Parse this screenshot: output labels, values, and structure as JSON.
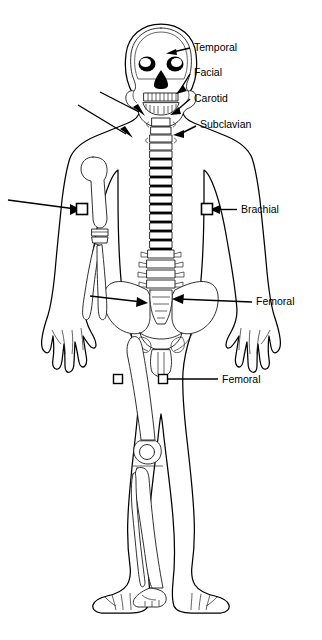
{
  "figure": {
    "view": "anterior full-body outline with partial skeleton",
    "background_color": "#ffffff",
    "line_color": "#000000",
    "text_color": "#000000",
    "width": 322,
    "height": 640
  },
  "labels": [
    {
      "id": "temporal",
      "text": "Temporal",
      "x": 194,
      "y": 48
    },
    {
      "id": "facial",
      "text": "Facial",
      "x": 194,
      "y": 73
    },
    {
      "id": "carotid",
      "text": "Carotid",
      "x": 194,
      "y": 99
    },
    {
      "id": "subclavian",
      "text": "Subclavian",
      "x": 200,
      "y": 125
    },
    {
      "id": "brachial",
      "text": "Brachial",
      "x": 241,
      "y": 210
    },
    {
      "id": "femoral-groin",
      "text": "Femoral",
      "x": 256,
      "y": 302
    },
    {
      "id": "femoral-thigh",
      "text": "Femoral",
      "x": 222,
      "y": 380
    }
  ],
  "markers": [
    {
      "id": "brachial-left",
      "label": "Brachial",
      "x": 82,
      "y": 209,
      "size": 11
    },
    {
      "id": "brachial-right",
      "label": "Brachial",
      "x": 207,
      "y": 209,
      "size": 11
    },
    {
      "id": "femoral-left-thigh",
      "label": "Femoral",
      "x": 118,
      "y": 379,
      "size": 9
    },
    {
      "id": "femoral-right-thigh",
      "label": "Femoral",
      "x": 163,
      "y": 379,
      "size": 9
    }
  ],
  "anatomy_parts": [
    "skull",
    "eye-sockets",
    "nasal-cavity",
    "teeth",
    "mandible",
    "cervical-spine",
    "thoracic-spine",
    "lumbar-spine",
    "pelvis",
    "sacrum",
    "humerus",
    "radius",
    "ulna",
    "femur",
    "patella",
    "tibia",
    "fibula",
    "foot-bones",
    "body-outline",
    "hands",
    "feet"
  ]
}
